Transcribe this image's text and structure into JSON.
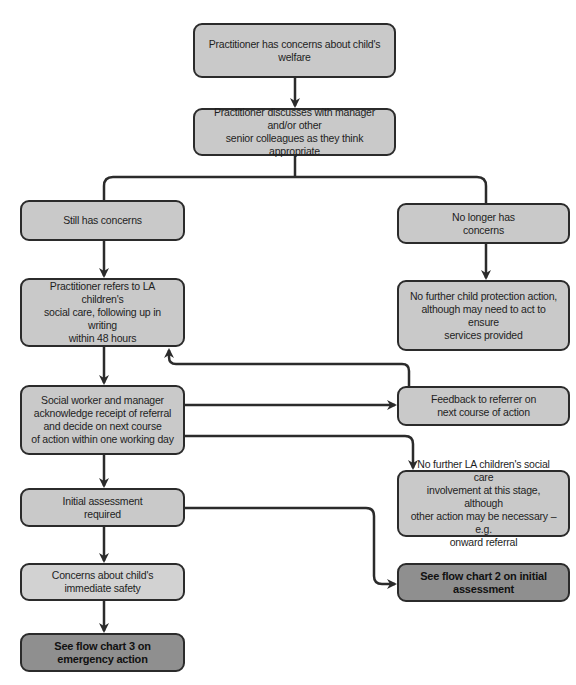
{
  "diagram": {
    "type": "flowchart",
    "nodes": [
      {
        "id": "concerns",
        "label": "Practitioner has concerns about child's welfare"
      },
      {
        "id": "discusses",
        "label": "Practitioner discusses with manager and/or other\nsenior colleagues as they think appropriate"
      },
      {
        "id": "still",
        "label": "Still has concerns"
      },
      {
        "id": "nolonger",
        "label": "No longer has\nconcerns"
      },
      {
        "id": "refers",
        "label": "Practitioner refers to LA children's\nsocial care, following up in writing\nwithin 48 hours"
      },
      {
        "id": "nocp",
        "label": "No further child protection action,\nalthough may need to act to ensure\nservices provided"
      },
      {
        "id": "socialworker",
        "label": "Social worker and manager\nacknowledge receipt of referral\nand decide on next course\nof action within one working day"
      },
      {
        "id": "feedback",
        "label": "Feedback to referrer on\nnext course of action"
      },
      {
        "id": "nola",
        "label": "No further LA children's social care\ninvolvement at this stage, although\nother action may be necessary – e.g.\nonward referral"
      },
      {
        "id": "initial",
        "label": "Initial assessment\nrequired"
      },
      {
        "id": "flow2",
        "label": "See flow chart 2 on initial\nassessment"
      },
      {
        "id": "safety",
        "label": "Concerns about child's\nimmediate safety"
      },
      {
        "id": "flow3",
        "label": "See flow chart 3 on\nemergency action"
      }
    ],
    "edges": [
      {
        "from": "concerns",
        "to": "discusses"
      },
      {
        "from": "discusses",
        "to": "still"
      },
      {
        "from": "discusses",
        "to": "nolonger"
      },
      {
        "from": "still",
        "to": "refers"
      },
      {
        "from": "nolonger",
        "to": "nocp"
      },
      {
        "from": "refers",
        "to": "socialworker"
      },
      {
        "from": "socialworker",
        "to": "feedback"
      },
      {
        "from": "feedback",
        "to": "refers"
      },
      {
        "from": "socialworker",
        "to": "nola"
      },
      {
        "from": "socialworker",
        "to": "initial"
      },
      {
        "from": "initial",
        "to": "flow2"
      },
      {
        "from": "initial",
        "to": "safety"
      },
      {
        "from": "safety",
        "to": "flow3"
      }
    ]
  },
  "colors": {
    "box_fill": "#c9c9c9",
    "terminal_fill": "#8f8f8f",
    "stroke": "#2b2b2b"
  }
}
